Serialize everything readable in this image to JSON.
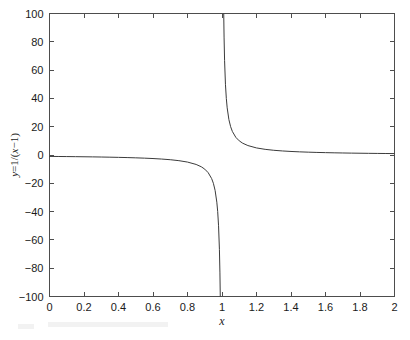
{
  "figure": {
    "background_color": "#ffffff",
    "axes_color": "#4d4d4d",
    "curve_color": "#3b3b3b",
    "text_color": "#1a1a1a"
  },
  "chart_data": {
    "type": "line",
    "title": "",
    "xlabel": "x",
    "ylabel": "y=1/(x−1)",
    "expression": "y=1/(x-1)",
    "xlim": [
      0,
      2
    ],
    "ylim": [
      -100,
      100
    ],
    "grid": false,
    "legend": null,
    "xticks": [
      0,
      0.2,
      0.4,
      0.6,
      0.8,
      1,
      1.2,
      1.4,
      1.6,
      1.8,
      2
    ],
    "xticklabels": [
      "0",
      "0.2",
      "0.4",
      "0.6",
      "0.8",
      "1",
      "1.2",
      "1.4",
      "1.6",
      "1.8",
      "2"
    ],
    "yticks": [
      -100,
      -80,
      -60,
      -40,
      -20,
      0,
      20,
      40,
      60,
      80,
      100
    ],
    "yticklabels": [
      "−100",
      "−80",
      "−60",
      "−40",
      "−20",
      "0",
      "20",
      "40",
      "60",
      "80",
      "100"
    ],
    "asymptote_x": 1,
    "series": [
      {
        "name": "left-branch",
        "x": [
          0.0,
          0.05,
          0.1,
          0.15,
          0.2,
          0.25,
          0.3,
          0.35,
          0.4,
          0.45,
          0.5,
          0.55,
          0.6,
          0.65,
          0.7,
          0.75,
          0.8,
          0.85,
          0.88,
          0.9,
          0.92,
          0.94,
          0.95,
          0.96,
          0.97,
          0.975,
          0.98,
          0.985,
          0.988,
          0.99
        ],
        "values": [
          -1.0,
          -1.05,
          -1.11,
          -1.18,
          -1.25,
          -1.33,
          -1.43,
          -1.54,
          -1.67,
          -1.82,
          -2.0,
          -2.22,
          -2.5,
          -2.86,
          -3.33,
          -4.0,
          -5.0,
          -6.67,
          -8.33,
          -10.0,
          -12.5,
          -16.67,
          -20.0,
          -25.0,
          -33.33,
          -40.0,
          -50.0,
          -66.67,
          -83.33,
          -100.0
        ]
      },
      {
        "name": "right-branch",
        "x": [
          1.01,
          1.012,
          1.015,
          1.02,
          1.025,
          1.03,
          1.04,
          1.05,
          1.06,
          1.08,
          1.1,
          1.12,
          1.15,
          1.2,
          1.25,
          1.3,
          1.35,
          1.4,
          1.45,
          1.5,
          1.55,
          1.6,
          1.65,
          1.7,
          1.75,
          1.8,
          1.85,
          1.9,
          1.95,
          2.0
        ],
        "values": [
          100.0,
          83.33,
          66.67,
          50.0,
          40.0,
          33.33,
          25.0,
          20.0,
          16.67,
          12.5,
          10.0,
          8.33,
          6.67,
          5.0,
          4.0,
          3.33,
          2.86,
          2.5,
          2.22,
          2.0,
          1.82,
          1.67,
          1.54,
          1.43,
          1.33,
          1.25,
          1.18,
          1.11,
          1.05,
          1.0
        ]
      }
    ]
  }
}
